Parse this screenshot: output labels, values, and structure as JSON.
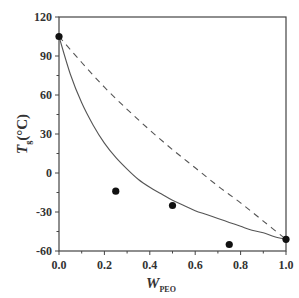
{
  "chart_data": {
    "type": "scatter",
    "title": "",
    "xlabel": "W",
    "xlabel_sub": "PEO",
    "ylabel": "T",
    "ylabel_sub": "g",
    "ylabel_unit": "(°C)",
    "xlim": [
      0.0,
      1.0
    ],
    "ylim": [
      -60,
      120
    ],
    "x_ticks": [
      0.0,
      0.2,
      0.4,
      0.6,
      0.8,
      1.0
    ],
    "x_tick_labels": [
      "0.0",
      "0.2",
      "0.4",
      "0.6",
      "0.8",
      "1.0"
    ],
    "y_ticks": [
      -60,
      -30,
      0,
      30,
      60,
      90,
      120
    ],
    "y_tick_labels": [
      "-60",
      "-30",
      "0",
      "30",
      "60",
      "90",
      "120"
    ],
    "grid": false,
    "legend": null,
    "series": [
      {
        "name": "experimental",
        "style": "markers",
        "marker": "filled-circle",
        "x": [
          0.0,
          0.25,
          0.5,
          0.75,
          1.0
        ],
        "y": [
          105,
          -14,
          -25,
          -55,
          -51
        ]
      },
      {
        "name": "solid-curve",
        "style": "solid-line",
        "x": [
          0.0,
          0.05,
          0.1,
          0.15,
          0.2,
          0.25,
          0.3,
          0.35,
          0.4,
          0.45,
          0.5,
          0.55,
          0.6,
          0.65,
          0.7,
          0.75,
          0.8,
          0.85,
          0.9,
          0.95,
          1.0
        ],
        "y": [
          105,
          76,
          54,
          37,
          23,
          12,
          3,
          -5,
          -11,
          -16,
          -21,
          -25,
          -29,
          -32,
          -35,
          -38,
          -41,
          -44,
          -46,
          -49,
          -51
        ]
      },
      {
        "name": "dashed-curve",
        "style": "dashed-line",
        "x": [
          0.0,
          0.1,
          0.2,
          0.3,
          0.4,
          0.5,
          0.6,
          0.7,
          0.8,
          0.9,
          1.0
        ],
        "y": [
          105,
          85,
          66,
          49,
          33,
          18,
          4,
          -10,
          -23,
          -37,
          -51
        ]
      }
    ]
  }
}
